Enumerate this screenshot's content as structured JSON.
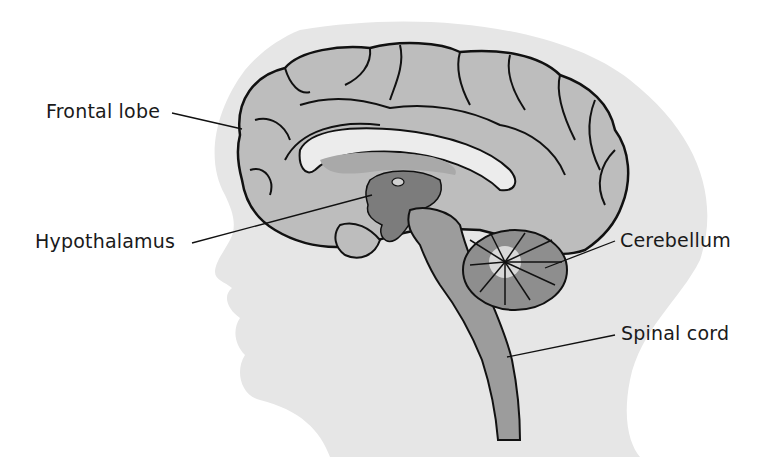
{
  "diagram": {
    "type": "anatomical-illustration",
    "labels": [
      {
        "id": "frontal-lobe",
        "text": "Frontal lobe"
      },
      {
        "id": "hypothalamus",
        "text": "Hypothalamus"
      },
      {
        "id": "cerebellum",
        "text": "Cerebellum"
      },
      {
        "id": "spinal-cord",
        "text": "Spinal cord"
      }
    ]
  },
  "colors": {
    "background": "#ffffff",
    "head_silhouette": "#e6e6e6",
    "cortex": "#bdbdbd",
    "corpus_callosum": "#ececec",
    "ventricle": "#a9a9a9",
    "thalamus": "#7c7c7c",
    "brainstem": "#9c9c9c",
    "outline": "#111111",
    "label_text": "#1a1a1a"
  }
}
